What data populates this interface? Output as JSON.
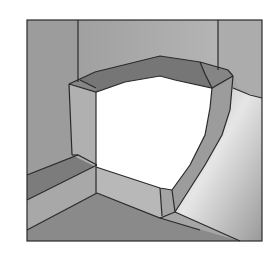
{
  "figure": {
    "title": "",
    "colors": {
      "background": "#ffffff",
      "frame": "#3a3a3a",
      "wall_back": "#a3a3a3",
      "wall_left": "#9a9a9a",
      "wall_right": "#b0b0b0",
      "floor": "#8c8c8c",
      "ring_top": "#787878",
      "ring_top_corner": "#858585",
      "ring_left_face": "#b2b2b2",
      "ring_right_face": "#9e9e9e",
      "ring_bottom_face": "#b8b8b8",
      "opening": "#ffffff",
      "left_step_dark": "#7e7e7e",
      "left_step_light": "#a8a8a8",
      "highlight": "#e8e8e8",
      "edge": "#2a2a2a"
    }
  }
}
